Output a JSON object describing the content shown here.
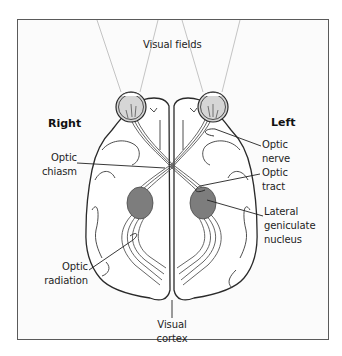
{
  "diagram": {
    "title": "Visual fields",
    "sides": {
      "right": "Right",
      "left": "Left"
    },
    "labels": {
      "optic_chiasm": [
        "Optic",
        "chiasm"
      ],
      "optic_nerve": [
        "Optic",
        "nerve"
      ],
      "optic_tract": [
        "Optic",
        "tract"
      ],
      "lateral_geniculate_nucleus": [
        "Lateral",
        "geniculate",
        "nucleus"
      ],
      "optic_radiation": [
        "Optic",
        "radiation"
      ],
      "visual_cortex": [
        "Visual",
        "cortex"
      ]
    },
    "colors": {
      "outline": "#2a2a2a",
      "pathway": "#555555",
      "lgn_fill": "#7d7d7d",
      "eye_fill": "#d6d6d6",
      "field_lines": "#b5b5b5",
      "frame": "#5a5a5a"
    }
  }
}
